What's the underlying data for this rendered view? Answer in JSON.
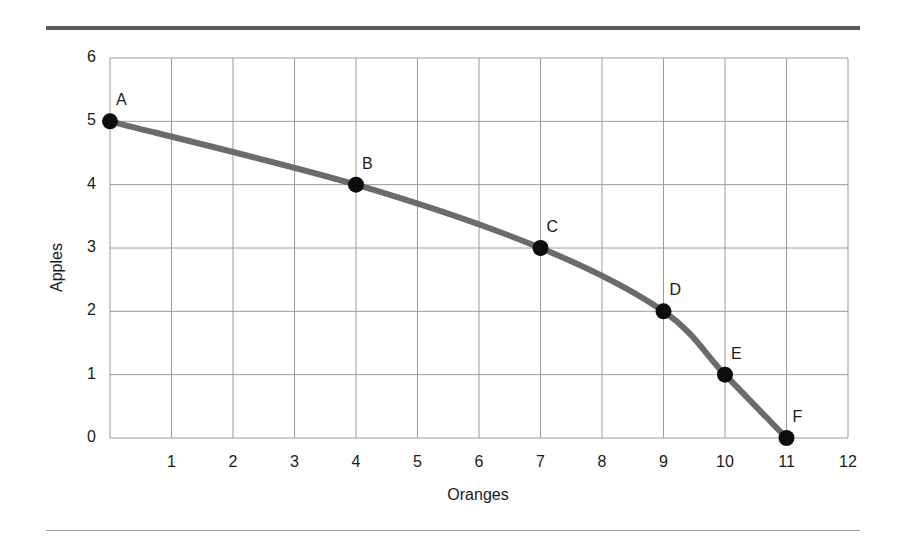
{
  "figure": {
    "top_rule_color": "#595959",
    "bottom_rule_color": "#9a9a9a",
    "background": "#ffffff"
  },
  "chart_data": {
    "type": "line",
    "title": "",
    "subtitle": "",
    "xlabel": "Oranges",
    "ylabel": "Apples",
    "xlim": [
      0,
      12
    ],
    "ylim": [
      0,
      6
    ],
    "xticks": [
      0,
      1,
      2,
      3,
      4,
      5,
      6,
      7,
      8,
      9,
      10,
      11,
      12
    ],
    "xtick_labels": [
      "",
      "1",
      "2",
      "3",
      "4",
      "5",
      "6",
      "7",
      "8",
      "9",
      "10",
      "11",
      "12"
    ],
    "yticks": [
      0,
      1,
      2,
      3,
      4,
      5,
      6
    ],
    "ytick_labels": [
      "0",
      "1",
      "2",
      "3",
      "4",
      "5",
      "6"
    ],
    "grid": true,
    "grid_color": "#9a9a9a",
    "legend": "none",
    "line_color": "#6b6b6b",
    "line_width": 6,
    "marker_color": "#0d0d0d",
    "marker_radius": 8,
    "x": [
      0,
      4,
      7,
      9,
      10,
      11
    ],
    "values": [
      5,
      4,
      3,
      2,
      1,
      0
    ],
    "point_labels": [
      "A",
      "B",
      "C",
      "D",
      "E",
      "F"
    ],
    "points": [
      {
        "label": "A",
        "x": 0,
        "y": 5
      },
      {
        "label": "B",
        "x": 4,
        "y": 4
      },
      {
        "label": "C",
        "x": 7,
        "y": 3
      },
      {
        "label": "D",
        "x": 9,
        "y": 2
      },
      {
        "label": "E",
        "x": 10,
        "y": 1
      },
      {
        "label": "F",
        "x": 11,
        "y": 0
      }
    ],
    "annotations": [
      "A",
      "B",
      "C",
      "D",
      "E",
      "F"
    ]
  }
}
